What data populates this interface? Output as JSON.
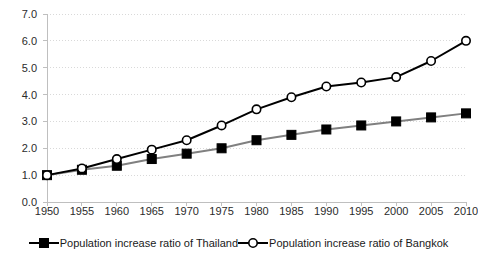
{
  "chart_data": {
    "type": "line",
    "title": "",
    "subtitle": "",
    "xlabel": "",
    "ylabel": "",
    "grid": true,
    "grid_axis": "y",
    "legend_position": "bottom",
    "x": [
      1950,
      1955,
      1960,
      1965,
      1970,
      1975,
      1980,
      1985,
      1990,
      1995,
      2000,
      2005,
      2010
    ],
    "categories": [
      "1950",
      "1955",
      "1960",
      "1965",
      "1970",
      "1975",
      "1980",
      "1985",
      "1990",
      "1995",
      "2000",
      "2005",
      "2010"
    ],
    "xlim": [
      1950,
      2010
    ],
    "ylim": [
      0.0,
      7.0
    ],
    "ytick_labels": [
      "0.0",
      "1.0",
      "2.0",
      "3.0",
      "4.0",
      "5.0",
      "6.0",
      "7.0"
    ],
    "yticks": [
      0.0,
      1.0,
      2.0,
      3.0,
      4.0,
      5.0,
      6.0,
      7.0
    ],
    "series": [
      {
        "name": "Population increase ratio of Thailand",
        "marker": "filled-square",
        "line_color": "#808080",
        "marker_color": "#000000",
        "values": [
          1.0,
          1.2,
          1.35,
          1.6,
          1.8,
          2.0,
          2.3,
          2.5,
          2.7,
          2.85,
          3.0,
          3.15,
          3.3
        ]
      },
      {
        "name": "Population increase ratio of Bangkok",
        "marker": "open-circle",
        "line_color": "#000000",
        "marker_color": "#ffffff",
        "values": [
          1.0,
          1.25,
          1.6,
          1.95,
          2.3,
          2.85,
          3.45,
          3.9,
          4.3,
          4.45,
          4.65,
          5.25,
          6.0
        ]
      }
    ]
  },
  "colors": {
    "grid": "#d9d9d9",
    "axis": "#bfbfbf",
    "text": "#2b2b2b",
    "thailand_line": "#808080",
    "bangkok_line": "#000000",
    "background": "#ffffff"
  }
}
